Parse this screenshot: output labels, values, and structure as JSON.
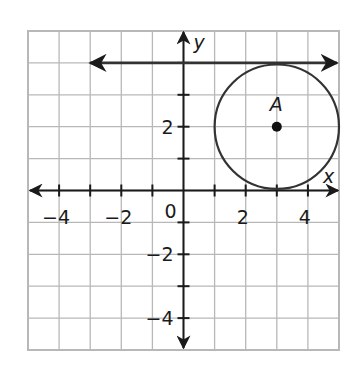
{
  "figure": {
    "type": "coordinate-plane",
    "x_range": [
      -5,
      5
    ],
    "y_range": [
      -5,
      5
    ],
    "grid_step": 1,
    "axis_labels": {
      "x": "x",
      "y": "y"
    },
    "x_tick_labels": [
      "−4",
      "−2",
      "0",
      "2",
      "4"
    ],
    "y_tick_labels": [
      "2",
      "−2",
      "−4"
    ],
    "point": {
      "label": "A",
      "x": 3,
      "y": 2
    },
    "circle": {
      "center": [
        3,
        2
      ],
      "radius": 2
    },
    "ray": {
      "y": 4,
      "from_x": -3,
      "to_x": 5,
      "arrows": "both"
    },
    "colors": {
      "grid": "#b8b8b8",
      "ink": "#1a1a1a",
      "background": "#ffffff"
    }
  }
}
